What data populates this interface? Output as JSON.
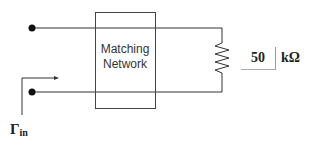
{
  "diagram": {
    "block": {
      "line1": "Matching",
      "line2": "Network"
    },
    "load": {
      "value": "50",
      "unit": "kΩ"
    },
    "reflection": {
      "symbol": "Γ",
      "subscript": "in"
    }
  },
  "colors": {
    "line": "#333333",
    "box": "#444444"
  }
}
